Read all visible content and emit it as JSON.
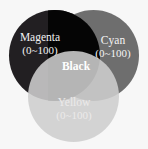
{
  "figure": {
    "background_color": "#f7f7f7"
  },
  "chart_data": {
    "type": "venn",
    "title": "",
    "set_count": 3,
    "sets": [
      {
        "id": "magenta",
        "name": "Magenta",
        "range": "(0~100)",
        "range_min": 0,
        "range_max": 100,
        "fill_color": "#221f22",
        "label_color": "#f2f2f2",
        "position": "top-left"
      },
      {
        "id": "cyan",
        "name": "Cyan",
        "range": "(0~100)",
        "range_min": 0,
        "range_max": 100,
        "fill_color": "#6e6e6e",
        "label_color": "#f4f4f4",
        "position": "top-right"
      },
      {
        "id": "yellow",
        "name": "Yellow",
        "range": "(0~100)",
        "range_min": 0,
        "range_max": 100,
        "fill_color": "#cecece",
        "label_color": "#eceaea",
        "position": "bottom-center"
      }
    ],
    "intersections": [
      {
        "id": "black",
        "name": "Black",
        "members": [
          "magenta",
          "cyan"
        ],
        "fill_color": "#050505",
        "label_color": "#ffffff"
      }
    ]
  }
}
